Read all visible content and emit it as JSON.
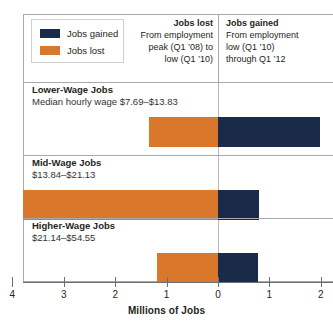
{
  "legend": {
    "items": [
      {
        "label": "Jobs gained",
        "color": "#1a2a49",
        "name": "legend-jobs-gained"
      },
      {
        "label": "Jobs lost",
        "color": "#d9782b",
        "name": "legend-jobs-lost"
      }
    ]
  },
  "headers": {
    "lost": {
      "title": "Jobs lost",
      "sub_line1": "From employment",
      "sub_line2": "peak (Q1 ’08) to",
      "sub_line3": "low (Q1 ’10)"
    },
    "gained": {
      "title": "Jobs gained",
      "sub_line1": "From employment",
      "sub_line2": "low (Q1 ’10)",
      "sub_line3": "through Q1 ’12"
    }
  },
  "axis": {
    "title": "Millions of Jobs",
    "ticks": [
      "4",
      "3",
      "2",
      "1",
      "0",
      "1",
      "2"
    ],
    "left_value": 4,
    "right_value": 2,
    "zero_label": "0"
  },
  "rows": [
    {
      "name": "Lower-Wage Jobs",
      "sub": "Median hourly wage $7.69–$13.83",
      "lost": 1.35,
      "gained": 1.98
    },
    {
      "name": "Mid-Wage Jobs",
      "sub": "$13.84–$21.13",
      "lost": 3.79,
      "gained": 0.8
    },
    {
      "name": "Higher-Wage Jobs",
      "sub": "$21.14–$54.55",
      "lost": 1.19,
      "gained": 0.78
    }
  ],
  "chart_data": {
    "type": "bar",
    "orientation": "horizontal",
    "layout": "diverging",
    "title": "",
    "xlabel": "Millions of Jobs",
    "ylabel": "",
    "xlim": [
      -4,
      2
    ],
    "xticks": [
      -4,
      -3,
      -2,
      -1,
      0,
      1,
      2
    ],
    "xticklabels": [
      "4",
      "3",
      "2",
      "1",
      "0",
      "1",
      "2"
    ],
    "grid": false,
    "legend_position": "top-left",
    "categories": [
      "Lower-Wage Jobs",
      "Mid-Wage Jobs",
      "Higher-Wage Jobs"
    ],
    "series": [
      {
        "name": "Jobs lost",
        "color": "#d9782b",
        "values": [
          -1.35,
          -3.79,
          -1.19
        ]
      },
      {
        "name": "Jobs gained",
        "color": "#1a2a49",
        "values": [
          1.98,
          0.8,
          0.78
        ]
      }
    ],
    "annotations": [
      "Jobs lost: From employment peak (Q1 '08) to low (Q1 '10)",
      "Jobs gained: From employment low (Q1 '10) through Q1 '12",
      "Lower-Wage Jobs: Median hourly wage $7.69–$13.83",
      "Mid-Wage Jobs: $13.84–$21.13",
      "Higher-Wage Jobs: $21.14–$54.55"
    ]
  },
  "geometry": {
    "zero_x": 218,
    "px_per_unit": 51.4
  }
}
